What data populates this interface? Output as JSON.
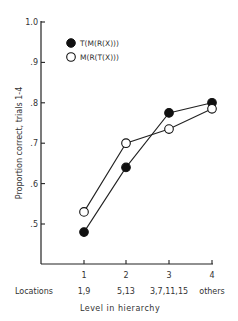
{
  "chart_data": {
    "type": "line",
    "title": "",
    "xlabel": "Level in hierarchy",
    "ylabel": "Proportion correct, trials 1-4",
    "categories": [
      "1",
      "2",
      "3",
      "4"
    ],
    "category_sublabels_title": "Locations",
    "category_sublabels": [
      "1,9",
      "5,13",
      "3,7,11,15",
      "others"
    ],
    "ylim": [
      0.45,
      1.0
    ],
    "yticks": [
      1.0,
      0.9,
      0.8,
      0.7,
      0.6,
      0.5
    ],
    "ytick_labels": [
      "1.0",
      ".9",
      ".8",
      ".7",
      ".6",
      ".5"
    ],
    "grid": false,
    "legend_position": "upper-left",
    "series": [
      {
        "name": "T(M(R(X)))",
        "marker": "filled-circle",
        "color": "#111111",
        "values": [
          0.48,
          0.64,
          0.775,
          0.8
        ]
      },
      {
        "name": "M(R(T(X)))",
        "marker": "open-circle",
        "color": "#111111",
        "values": [
          0.53,
          0.7,
          0.735,
          0.785
        ]
      }
    ]
  },
  "labels": {
    "ylabel": "Proportion correct, trials 1-4",
    "xlabel": "Level in hierarchy",
    "locations": "Locations",
    "legend_filled": "T(M(R(X)))",
    "legend_open": "M(R(T(X)))"
  }
}
